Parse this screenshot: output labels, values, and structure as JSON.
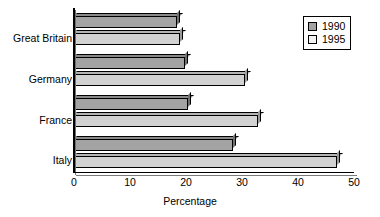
{
  "chart_data": {
    "type": "bar",
    "orientation": "horizontal",
    "title": "",
    "xlabel": "Percentage",
    "ylabel": "",
    "categories": [
      "Great Britain",
      "Germany",
      "France",
      "Italy"
    ],
    "series": [
      {
        "name": "1990",
        "color": "#a3a3a3",
        "values": [
          18.4,
          19.8,
          20.4,
          28.4
        ]
      },
      {
        "name": "1995",
        "color": "#d2d2d2",
        "values": [
          18.9,
          30.5,
          32.9,
          47.0
        ]
      }
    ],
    "xlim": [
      0,
      50
    ],
    "xticks": [
      0,
      10,
      20,
      30,
      40,
      50
    ],
    "xtick_labels": [
      "0",
      "10",
      "20",
      "30",
      "40",
      "50"
    ],
    "grid": false,
    "legend_position": "top-right"
  },
  "legend": {
    "entries": [
      {
        "label": "1990",
        "swatch": "swatch-1990"
      },
      {
        "label": "1995",
        "swatch": "swatch-1995"
      }
    ]
  },
  "axis": {
    "x_title": "Percentage"
  }
}
